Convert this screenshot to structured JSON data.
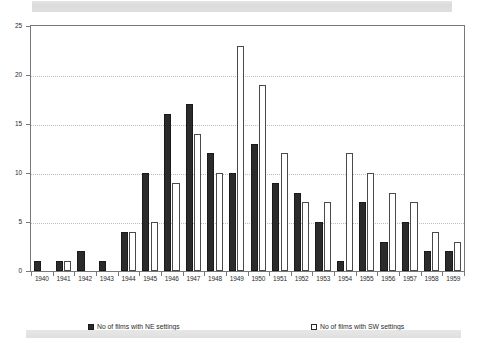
{
  "chart_data": {
    "type": "bar",
    "title": "",
    "xlabel": "",
    "ylabel": "",
    "ylim": [
      0,
      25
    ],
    "yticks": [
      0,
      5,
      10,
      15,
      20,
      25
    ],
    "grid": true,
    "legend_position": "bottom",
    "categories": [
      "1940",
      "1941",
      "1942",
      "1943",
      "1944",
      "1945",
      "1946",
      "1947",
      "1948",
      "1949",
      "1950",
      "1951",
      "1952",
      "1953",
      "1954",
      "1955",
      "1956",
      "1957",
      "1958",
      "1959"
    ],
    "series": [
      {
        "name": "No of films with NE settings",
        "style": "filled",
        "color": "#2b2b2b",
        "values": [
          1,
          1,
          2,
          1,
          4,
          10,
          16,
          17,
          12,
          10,
          13,
          9,
          8,
          5,
          1,
          7,
          3,
          5,
          2,
          2
        ]
      },
      {
        "name": "No of films with SW settings",
        "style": "hollow",
        "color": "#ffffff",
        "values": [
          0,
          1,
          0,
          0,
          4,
          5,
          9,
          14,
          10,
          23,
          19,
          12,
          7,
          7,
          12,
          10,
          8,
          7,
          4,
          3
        ]
      }
    ]
  },
  "legend": {
    "entries": [
      {
        "label": "No of films with NE settings"
      },
      {
        "label": "No of films with SW settings"
      }
    ]
  }
}
